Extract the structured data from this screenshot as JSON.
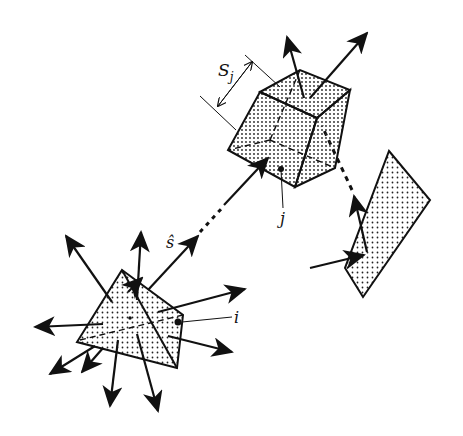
{
  "diagram": {
    "type": "radiative-exchange-schematic",
    "labels": {
      "source_element": "i",
      "receiver_element": "j",
      "direction": "ŝ",
      "size_symbol": "S",
      "size_subscript": "j"
    },
    "elements": [
      {
        "id": "i",
        "shape": "tetrahedron",
        "role": "emitting volume element"
      },
      {
        "id": "j",
        "shape": "cube",
        "role": "receiving volume element"
      },
      {
        "id": "wall",
        "shape": "parallelogram",
        "role": "reflecting surface"
      }
    ],
    "colors": {
      "stroke": "#111111",
      "fill": "#ffffff",
      "dots": "#222222"
    }
  }
}
